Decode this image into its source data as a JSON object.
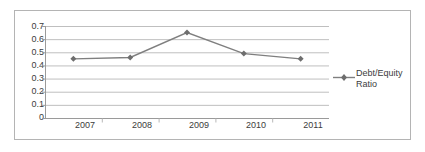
{
  "chart_data": {
    "type": "line",
    "title": "",
    "xlabel": "",
    "ylabel": "",
    "categories": [
      "2007",
      "2008",
      "2009",
      "2010",
      "2011"
    ],
    "series": [
      {
        "name": "Debt/Equity Ratio",
        "values": [
          0.45,
          0.46,
          0.65,
          0.49,
          0.45
        ],
        "color": "#7f7f7f",
        "marker": "diamond"
      }
    ],
    "ylim": [
      0,
      0.7
    ],
    "yticks": [
      "0",
      "0.1",
      "0.2",
      "0.3",
      "0.4",
      "0.5",
      "0.6",
      "0.7"
    ],
    "ytick_values": [
      0,
      0.1,
      0.2,
      0.3,
      0.4,
      0.5,
      0.6,
      0.7
    ],
    "grid": true,
    "grid_axis": "y",
    "grid_color": "#bfbfbf",
    "legend_position": "right",
    "plot_border": "#b4b4b4",
    "text_color": "#3c3c3c"
  },
  "legend": {
    "entries": [
      {
        "label_line1": "Debt/Equity",
        "label_line2": "Ratio"
      }
    ]
  },
  "axes": {
    "y_tick_labels": [
      "0.7",
      "0.6",
      "0.5",
      "0.4",
      "0.3",
      "0.2",
      "0.1",
      "0"
    ],
    "x_tick_labels": [
      "2007",
      "2008",
      "2009",
      "2010",
      "2011"
    ]
  }
}
